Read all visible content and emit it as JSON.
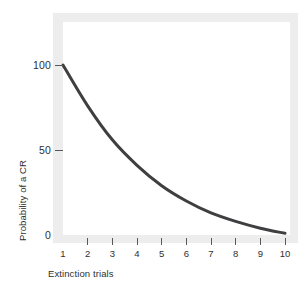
{
  "chart_data": {
    "type": "line",
    "title": "",
    "xlabel": "Extinction trials",
    "ylabel": "Probability of a CR",
    "x": [
      1,
      2,
      3,
      4,
      5,
      6,
      7,
      8,
      9,
      10
    ],
    "series": [
      {
        "name": "Probability of a CR",
        "values": [
          100,
          76,
          56,
          41,
          29,
          20,
          13,
          8,
          4,
          1
        ],
        "color": "#3f3f41",
        "line_width": 3
      }
    ],
    "xlim": [
      1,
      10
    ],
    "ylim": [
      0,
      100
    ],
    "x_ticks": [
      {
        "value": 1,
        "label": "1",
        "has_mark": false
      },
      {
        "value": 2,
        "label": "2",
        "has_mark": true
      },
      {
        "value": 3,
        "label": "3",
        "has_mark": true
      },
      {
        "value": 4,
        "label": "4",
        "has_mark": true
      },
      {
        "value": 5,
        "label": "5",
        "has_mark": true
      },
      {
        "value": 6,
        "label": "6",
        "has_mark": true
      },
      {
        "value": 7,
        "label": "7",
        "has_mark": true
      },
      {
        "value": 8,
        "label": "8",
        "has_mark": true
      },
      {
        "value": 9,
        "label": "9",
        "has_mark": true
      },
      {
        "value": 10,
        "label": "10",
        "has_mark": true
      }
    ],
    "y_ticks": [
      {
        "value": 100,
        "label": "100"
      },
      {
        "value": 50,
        "label": "50"
      },
      {
        "value": 0,
        "label": "0"
      }
    ],
    "grid": false,
    "legend": "none",
    "frame_color": "#ededed",
    "plot_background": "#ffffff",
    "text_color": "#2f2f31",
    "tick_color": "#58585a"
  }
}
